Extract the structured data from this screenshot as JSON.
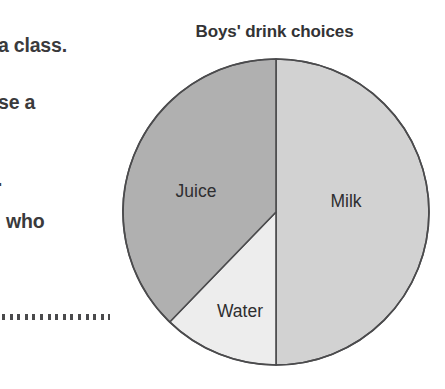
{
  "page": {
    "background": "#ffffff",
    "width": 445,
    "height": 389
  },
  "worksheet_margin_text": {
    "fragment_1": "a class.",
    "fragment_2": "se a",
    "fragment_3": ".",
    "fragment_4": "who",
    "answer_line": "..............."
  },
  "chart_data": {
    "type": "pie",
    "title": "Boys' drink choices",
    "xlabel": "",
    "ylabel": "",
    "legend": "none",
    "labels_position": "inside-slices",
    "categories": [
      "Milk",
      "Juice",
      "Water"
    ],
    "values": [
      50,
      37,
      13
    ],
    "units": "percent",
    "start_angle_deg": 0,
    "direction": "clockwise",
    "slices": [
      {
        "label": "Milk",
        "value": 50,
        "percent": 50,
        "color": "#d2d2d2",
        "start_angle_deg": 0,
        "end_angle_deg": 180,
        "label_x": 346,
        "label_y": 202
      },
      {
        "label": "Water",
        "value": 13,
        "percent": 13,
        "color": "#ededed",
        "start_angle_deg": 180,
        "end_angle_deg": 224,
        "label_x": 240,
        "label_y": 312
      },
      {
        "label": "Juice",
        "value": 37,
        "percent": 37,
        "color": "#b0b0b0",
        "start_angle_deg": 224,
        "end_angle_deg": 360,
        "label_x": 196,
        "label_y": 192
      }
    ],
    "geometry": {
      "center_x": 276,
      "center_y": 212,
      "radius": 153
    },
    "stroke_color": "#4b4b4d",
    "stroke_width": 1.6
  }
}
